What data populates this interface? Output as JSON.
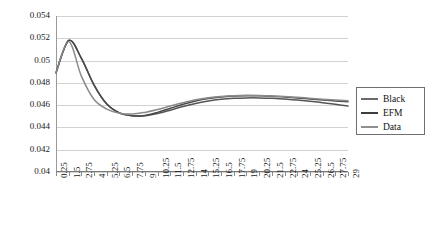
{
  "chart_data": {
    "type": "line",
    "title": "",
    "xlabel": "",
    "ylabel": "",
    "ylim": [
      0.04,
      0.054
    ],
    "ytick_step": 0.002,
    "grid": true,
    "legend_position": "right",
    "yticks": [
      "0.054",
      "0.052",
      "0.05",
      "0.048",
      "0.046",
      "0.044",
      "0.042",
      "0.04"
    ],
    "ytick_values": [
      0.054,
      0.052,
      0.05,
      0.048,
      0.046,
      0.044,
      0.042,
      0.04
    ],
    "categories": [
      "0.25",
      "1.5",
      "2.75",
      "4",
      "5.25",
      "6.5",
      "7.75",
      "9",
      "10.25",
      "11.5",
      "12.75",
      "14",
      "15.25",
      "16.5",
      "17.75",
      "19",
      "20.25",
      "21.5",
      "22.75",
      "24",
      "25.25",
      "26.5",
      "27.75",
      "29"
    ],
    "x": [
      0.25,
      1.5,
      2.75,
      4,
      5.25,
      6.5,
      7.75,
      9,
      10.25,
      11.5,
      12.75,
      14,
      15.25,
      16.5,
      17.75,
      19,
      20.25,
      21.5,
      22.75,
      24,
      25.25,
      26.5,
      27.75,
      29
    ],
    "series": [
      {
        "name": "Black",
        "color": "#555555",
        "values": [
          0.0489,
          0.0518,
          0.0502,
          0.0478,
          0.0461,
          0.0453,
          0.04505,
          0.04505,
          0.04525,
          0.04555,
          0.04588,
          0.04615,
          0.04637,
          0.04652,
          0.04661,
          0.04665,
          0.04665,
          0.04662,
          0.04655,
          0.04646,
          0.04635,
          0.04622,
          0.04608,
          0.04592
        ]
      },
      {
        "name": "EFM",
        "color": "#4a4a4a",
        "values": [
          0.0489,
          0.0518,
          0.0502,
          0.0478,
          0.0461,
          0.0453,
          0.04505,
          0.04508,
          0.04535,
          0.04572,
          0.04608,
          0.04638,
          0.0466,
          0.04674,
          0.04682,
          0.04685,
          0.04684,
          0.0468,
          0.04673,
          0.04665,
          0.04656,
          0.04647,
          0.04638,
          0.0463
        ]
      },
      {
        "name": "Data",
        "color": "#8a8a8a",
        "values": [
          0.0489,
          0.0517,
          0.0486,
          0.0465,
          0.04565,
          0.04528,
          0.0452,
          0.04535,
          0.0456,
          0.04592,
          0.04622,
          0.04648,
          0.04666,
          0.04678,
          0.04685,
          0.04688,
          0.04687,
          0.04683,
          0.04677,
          0.0467,
          0.04662,
          0.04654,
          0.04647,
          0.0464
        ]
      }
    ]
  },
  "legend": {
    "items": [
      {
        "label": "Black",
        "color": "#6a6a6a"
      },
      {
        "label": "EFM",
        "color": "#3d3d3d"
      },
      {
        "label": "Data",
        "color": "#8f8f8f"
      }
    ]
  },
  "colors": {
    "grid": "#d2d2d2",
    "axis": "#8d8d8d",
    "text": "#1a1a1a",
    "background": "#ffffff"
  }
}
